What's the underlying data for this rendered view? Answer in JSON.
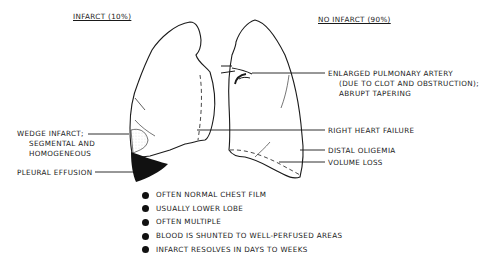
{
  "headers": {
    "infarct": "INFARCT (10%)",
    "no_infarct": "NO INFARCT (90%)"
  },
  "left_labels": {
    "wedge_line1": "WEDGE INFARCT;",
    "wedge_line2": "SEGMENTAL AND",
    "wedge_line3": "HOMOGENEOUS",
    "pleural": "PLEURAL EFFUSION"
  },
  "right_labels": {
    "artery_line1": "ENLARGED PULMONARY ARTERY",
    "artery_line2": "(DUE TO CLOT AND OBSTRUCTION);",
    "artery_line3": "ABRUPT TAPERING",
    "heart": "RIGHT HEART FAILURE",
    "oligemia": "DISTAL OLIGEMIA",
    "volume": "VOLUME LOSS"
  },
  "bullets": [
    "OFTEN NORMAL CHEST FILM",
    "USUALLY LOWER LOBE",
    "OFTEN MULTIPLE",
    "BLOOD IS SHUNTED TO WELL-PERFUSED AREAS",
    "INFARCT RESOLVES IN DAYS TO WEEKS"
  ],
  "colors": {
    "ink": "#1a1a1a",
    "background": "#ffffff"
  }
}
